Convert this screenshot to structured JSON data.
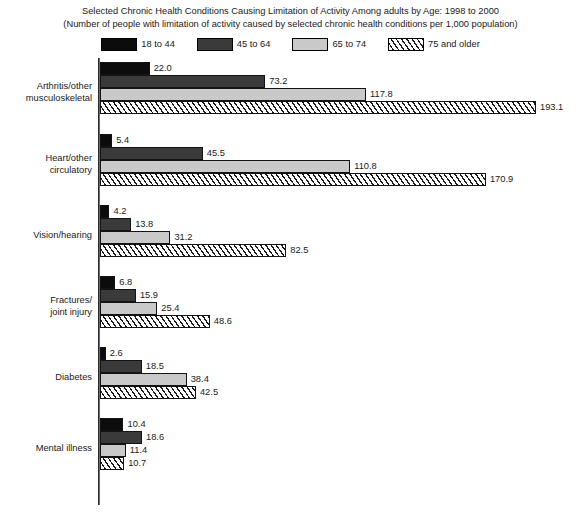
{
  "titles": {
    "line1": "Selected Chronic Health Conditions Causing Limitation of Activity Among adults by Age: 1998 to 2000",
    "line2": "(Number of people with limitation of activity caused by selected chronic health conditions per 1,000 population)"
  },
  "legend": {
    "entries": [
      {
        "label": "18 to 44",
        "swatch": "solid-black",
        "color": "#0c0c0c"
      },
      {
        "label": "45 to 64",
        "swatch": "solid-dark-gray",
        "color": "#3a3a3a"
      },
      {
        "label": "65 to 74",
        "swatch": "solid-light-gray",
        "color": "#c9c9c9"
      },
      {
        "label": "75 and older",
        "swatch": "diagonal-hatch",
        "color": "#ffffff"
      }
    ]
  },
  "chart_data": {
    "type": "bar",
    "orientation": "horizontal",
    "title": "Selected Chronic Health Conditions Causing Limitation of Activity Among adults by Age: 1998 to 2000",
    "subtitle": "(Number of people with limitation of activity caused by selected chronic health conditions per 1,000 population)",
    "xlabel": "",
    "ylabel": "",
    "xlim": [
      0,
      193.1
    ],
    "grid": false,
    "legend_position": "top-center",
    "data_labels": true,
    "categories": [
      "Arthritis/other musculoskeletal",
      "Heart/other circulatory",
      "Vision/hearing",
      "Fractures/ joint injury",
      "Diabetes",
      "Mental illness"
    ],
    "category_label_lines": [
      [
        "Arthritis/other",
        "musculoskeletal"
      ],
      [
        "Heart/other",
        "circulatory"
      ],
      [
        "Vision/hearing"
      ],
      [
        "Fractures/",
        "joint injury"
      ],
      [
        "Diabetes"
      ],
      [
        "Mental illness"
      ]
    ],
    "series": [
      {
        "name": "18 to 44",
        "values": [
          22.0,
          5.4,
          4.2,
          6.8,
          2.6,
          10.4
        ]
      },
      {
        "name": "45 to 64",
        "values": [
          73.2,
          45.5,
          13.8,
          15.9,
          18.5,
          18.6
        ]
      },
      {
        "name": "65 to 74",
        "values": [
          117.8,
          110.8,
          31.2,
          25.4,
          38.4,
          11.4
        ]
      },
      {
        "name": "75 and older",
        "values": [
          193.1,
          170.9,
          82.5,
          48.6,
          42.5,
          10.7
        ]
      }
    ],
    "value_labels": [
      [
        "22.0",
        "73.2",
        "117.8",
        "193.1"
      ],
      [
        "5.4",
        "45.5",
        "110.8",
        "170.9"
      ],
      [
        "4.2",
        "13.8",
        "31.2",
        "82.5"
      ],
      [
        "6.8",
        "15.9",
        "25.4",
        "48.6"
      ],
      [
        "2.6",
        "18.5",
        "38.4",
        "42.5"
      ],
      [
        "10.4",
        "18.6",
        "11.4",
        "10.7"
      ]
    ]
  }
}
